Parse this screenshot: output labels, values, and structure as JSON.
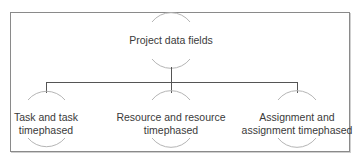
{
  "diagram": {
    "type": "hierarchy",
    "root": {
      "label": "Project data fields"
    },
    "children": [
      {
        "line1": "Task and task",
        "line2": "timephased"
      },
      {
        "line1": "Resource and resource",
        "line2": "timephased"
      },
      {
        "line1": "Assignment and",
        "line2": "assignment timephased"
      }
    ],
    "colors": {
      "frame": "#8a8a8a",
      "connector": "#555555",
      "arc": "#b5b5b5",
      "text": "#3a3a3a"
    }
  }
}
